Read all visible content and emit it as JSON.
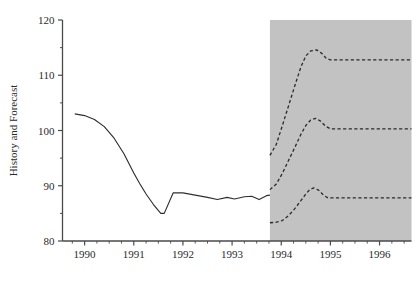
{
  "chart_data": {
    "type": "line",
    "title": "",
    "xlabel": "",
    "ylabel": "History and Forecast",
    "xlim": [
      1989.55,
      1996.65
    ],
    "ylim": [
      80,
      120
    ],
    "grid": false,
    "legend": "none",
    "x_ticks": [
      1990,
      1991,
      1992,
      1993,
      1994,
      1995,
      1996
    ],
    "x_tick_labels": [
      "1990",
      "1991",
      "1992",
      "1993",
      "1994",
      "1995",
      "1996"
    ],
    "x_minor_tick_step": 0.25,
    "y_ticks": [
      80,
      90,
      100,
      110,
      120
    ],
    "y_tick_labels": [
      "80",
      "90",
      "100",
      "110",
      "120"
    ],
    "shaded_region": {
      "label": "forecast-region",
      "x_start": 1993.77,
      "x_end": 1996.65,
      "color": "#c2c2c2"
    },
    "series": [
      {
        "name": "History",
        "style": "solid",
        "color": "#2f2f2f",
        "points": [
          [
            1989.8,
            103.0
          ],
          [
            1990.0,
            102.7
          ],
          [
            1990.2,
            102.0
          ],
          [
            1990.4,
            100.7
          ],
          [
            1990.6,
            98.6
          ],
          [
            1990.8,
            95.8
          ],
          [
            1991.0,
            92.3
          ],
          [
            1991.12,
            90.4
          ],
          [
            1991.25,
            88.5
          ],
          [
            1991.4,
            86.6
          ],
          [
            1991.55,
            85.0
          ],
          [
            1991.62,
            85.0
          ],
          [
            1991.8,
            88.7
          ],
          [
            1992.0,
            88.7
          ],
          [
            1992.25,
            88.3
          ],
          [
            1992.5,
            87.9
          ],
          [
            1992.7,
            87.5
          ],
          [
            1992.9,
            87.9
          ],
          [
            1993.05,
            87.6
          ],
          [
            1993.25,
            88.0
          ],
          [
            1993.4,
            88.1
          ],
          [
            1993.55,
            87.5
          ],
          [
            1993.7,
            88.2
          ],
          [
            1993.77,
            88.3
          ]
        ]
      },
      {
        "name": "Forecast High",
        "style": "dashed",
        "color": "#2a2a2a",
        "points": [
          [
            1993.77,
            95.5
          ],
          [
            1993.9,
            97.5
          ],
          [
            1994.02,
            100.8
          ],
          [
            1994.15,
            104.5
          ],
          [
            1994.28,
            108.2
          ],
          [
            1994.4,
            111.5
          ],
          [
            1994.5,
            113.5
          ],
          [
            1994.6,
            114.4
          ],
          [
            1994.72,
            114.6
          ],
          [
            1994.82,
            114.0
          ],
          [
            1994.92,
            113.0
          ],
          [
            1995.0,
            112.8
          ],
          [
            1995.4,
            112.8
          ],
          [
            1996.0,
            112.8
          ],
          [
            1996.65,
            112.8
          ]
        ]
      },
      {
        "name": "Forecast Mid",
        "style": "dashed",
        "color": "#2a2a2a",
        "points": [
          [
            1993.77,
            89.3
          ],
          [
            1993.9,
            90.3
          ],
          [
            1994.02,
            92.2
          ],
          [
            1994.15,
            94.6
          ],
          [
            1994.28,
            97.0
          ],
          [
            1994.4,
            99.3
          ],
          [
            1994.5,
            100.9
          ],
          [
            1994.6,
            101.9
          ],
          [
            1994.7,
            102.2
          ],
          [
            1994.8,
            101.7
          ],
          [
            1994.9,
            100.8
          ],
          [
            1995.0,
            100.3
          ],
          [
            1995.4,
            100.3
          ],
          [
            1996.0,
            100.3
          ],
          [
            1996.65,
            100.3
          ]
        ]
      },
      {
        "name": "Forecast Low",
        "style": "dashed",
        "color": "#2a2a2a",
        "points": [
          [
            1993.77,
            83.3
          ],
          [
            1993.9,
            83.4
          ],
          [
            1994.02,
            83.7
          ],
          [
            1994.15,
            84.6
          ],
          [
            1994.28,
            85.9
          ],
          [
            1994.4,
            87.3
          ],
          [
            1994.5,
            88.5
          ],
          [
            1994.58,
            89.3
          ],
          [
            1994.66,
            89.6
          ],
          [
            1994.76,
            89.2
          ],
          [
            1994.86,
            88.3
          ],
          [
            1994.95,
            87.8
          ],
          [
            1995.4,
            87.8
          ],
          [
            1996.0,
            87.8
          ],
          [
            1996.65,
            87.8
          ]
        ]
      }
    ]
  }
}
